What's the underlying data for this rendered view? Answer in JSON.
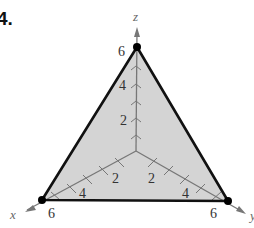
{
  "problem": {
    "number": "4."
  },
  "diagram": {
    "type": "3d-plane-triangle",
    "fill_color": "#d4d4d4",
    "edge_color": "#111111",
    "axis_color": "#777777",
    "axes": {
      "x": {
        "label": "x",
        "ticks": [
          "2",
          "4",
          "6"
        ]
      },
      "y": {
        "label": "y",
        "ticks": [
          "2",
          "4",
          "6"
        ]
      },
      "z": {
        "label": "z",
        "ticks": [
          "2",
          "4",
          "6"
        ]
      }
    },
    "vertices": [
      {
        "axis": "x",
        "value": "6"
      },
      {
        "axis": "y",
        "value": "6"
      },
      {
        "axis": "z",
        "value": "6"
      }
    ]
  }
}
